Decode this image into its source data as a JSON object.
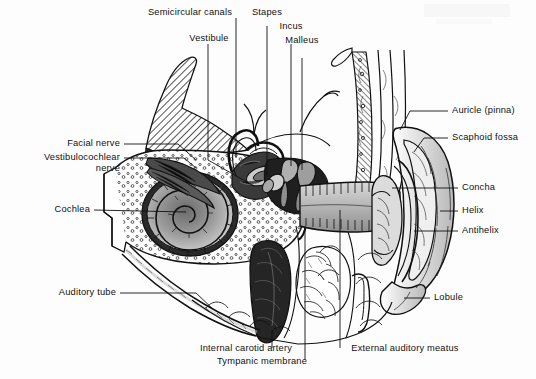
{
  "figure": {
    "background_color": "#fdfdfd",
    "ink_color": "#111111",
    "width": 536,
    "height": 379
  },
  "labels": {
    "semicircular_canals": "Semicircular canals",
    "vestibule": "Vestibule",
    "stapes": "Stapes",
    "incus": "Incus",
    "malleus": "Malleus",
    "auricle_pinna": "Auricle (pinna)",
    "scaphoid_fossa": "Scaphoid fossa",
    "concha": "Concha",
    "helix": "Helix",
    "antihelix": "Antihelix",
    "lobule": "Lobule",
    "facial_nerve": "Facial nerve",
    "vestibulocochlear_nerve_line1": "Vestibulocochlear",
    "vestibulocochlear_nerve_line2": "nerve",
    "cochlea": "Cochlea",
    "auditory_tube": "Auditory tube",
    "internal_carotid_artery": "Internal carotid artery",
    "tympanic_membrane": "Tympanic membrane",
    "external_auditory_meatus": "External auditory meatus"
  },
  "structures": [
    {
      "name": "temporal-bone",
      "description": "hatched petrous temporal bone, upper left"
    },
    {
      "name": "cochlea-spiral",
      "description": "spiral cochlea, left of center"
    },
    {
      "name": "semicircular-canals",
      "description": "looping canals above vestibule"
    },
    {
      "name": "vestibule",
      "description": "chamber between cochlea and canals"
    },
    {
      "name": "ossicles",
      "description": "malleus, incus and stapes in middle ear cavity"
    },
    {
      "name": "tympanic-membrane",
      "description": "eardrum at medial end of ear canal"
    },
    {
      "name": "external-auditory-meatus",
      "description": "ear canal leading to auricle"
    },
    {
      "name": "auricle",
      "description": "external ear with helix, antihelix, concha, lobule"
    },
    {
      "name": "mastoid-air-cells",
      "description": "stippled cells below ear canal"
    },
    {
      "name": "internal-carotid-artery",
      "description": "dark vertical vessel below middle ear"
    },
    {
      "name": "auditory-tube",
      "description": "eustachian tube running inferomedially"
    }
  ]
}
